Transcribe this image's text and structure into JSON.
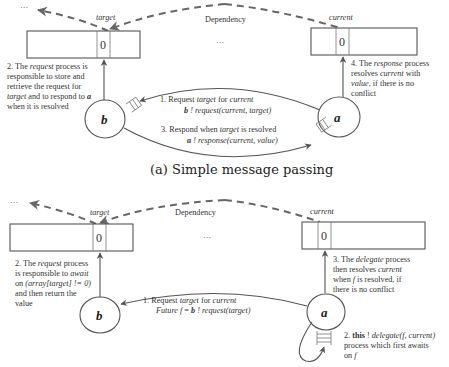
{
  "diagram_a": {
    "caption": "(a) Simple message passing",
    "ellipsis_top_left": "···",
    "ellipsis_middle": "···",
    "dependency_label": "Dependency",
    "array_left": {
      "label": "target",
      "cell_value": "0"
    },
    "array_right": {
      "label": "current",
      "cell_value": "0"
    },
    "node_b": "b",
    "node_a": "a",
    "note_left": {
      "line1_pre": "2. The ",
      "line1_em": "request",
      "line1_post": " process is",
      "line2": "responsible to store and",
      "line3": "retrieve the request for",
      "line4_em": "target",
      "line4_post": " and to respond to ",
      "line4_bold": "a",
      "line5": "when it is resolved"
    },
    "note_right": {
      "line1_pre": "4. The ",
      "line1_em": "response",
      "line1_post": " process",
      "line2_pre": "resolves ",
      "line2_em": "current",
      "line2_post": " with",
      "line3_em": "value",
      "line3_post": ",  if  there is no",
      "line4": "conflict"
    },
    "msg1": {
      "line1_pre": "1.   Request ",
      "line1_em1": "target",
      "line1_mid": " for ",
      "line1_em2": "current",
      "line2_bold": "b",
      "line2_em": " ! request(current, target)"
    },
    "msg3": {
      "line1_pre": "3. Respond when ",
      "line1_em": "target",
      "line1_post": " is resolved",
      "line2_bold": "a",
      "line2_em": " ! response(current, value)"
    }
  },
  "diagram_b": {
    "ellipsis_top_left": "···",
    "ellipsis_middle": "···",
    "dependency_label": "Dependency",
    "array_left": {
      "label": "target",
      "cell_value": "0"
    },
    "array_right": {
      "label": "current",
      "cell_value": "0"
    },
    "node_b": "b",
    "node_a": "a",
    "note_left": {
      "line1_pre": "2. The ",
      "line1_em": "request",
      "line1_post": " process",
      "line2_pre": "is responsible to ",
      "line2_em": "await",
      "line3_pre": "on  ",
      "line3_em": "(array[target] != 0)",
      "line4": "and then return the",
      "line5": "value"
    },
    "note_right": {
      "line1_pre": "3. The ",
      "line1_em": "delegate",
      "line1_post": " process",
      "line2_pre": "then resolves ",
      "line2_em": "current",
      "line3_pre": "when ",
      "line3_em": "f",
      "line3_post": " is resolved, if",
      "line4": "there is no conflict"
    },
    "msg1": {
      "line1_pre": "1.   Request ",
      "line1_em1": "target",
      "line1_mid": " for ",
      "line1_em2": "current",
      "line2_em1": "Future f",
      "line2_mid": " = ",
      "line2_bold": "b",
      "line2_em2": " ! request(target)"
    },
    "msg2": {
      "line1_pre": "2. ",
      "line1_bold": "this",
      "line1_mid": " ! ",
      "line1_em": "delegate(f, current)",
      "line2": "process which first awaits",
      "line3_pre": "on ",
      "line3_em": "f"
    }
  }
}
